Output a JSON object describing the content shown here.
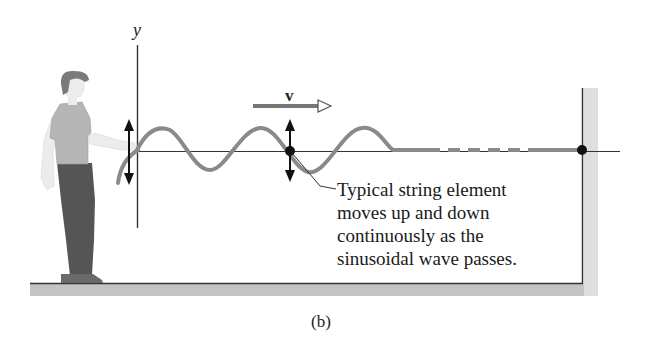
{
  "figure": {
    "part_label": "(b)",
    "axis": {
      "y_label": "y"
    },
    "velocity": {
      "label": "v"
    },
    "annotation": {
      "lines": [
        "Typical string element",
        "moves up and down",
        "continuously as the",
        "sinusoidal wave passes."
      ]
    },
    "colors": {
      "wave": "#8a8a8a",
      "axis": "#333333",
      "floor": "#c4c4c4",
      "wall": "#dedede",
      "shirt": "#b5b5b5",
      "pants": "#555555",
      "hair": "#7a7a7a",
      "skin": "#ececec",
      "dot": "#111111"
    }
  }
}
